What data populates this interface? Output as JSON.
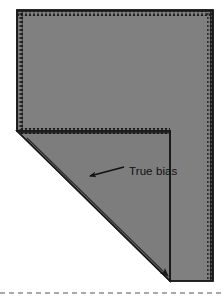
{
  "figure": {
    "annotation": {
      "label": "True bias",
      "arrow": "left-pointing-arrow"
    },
    "colors": {
      "fabric_fill": "#808080",
      "fold_flap_fill": "#7b7b7b",
      "outline": "#1a1a1a",
      "background": "#ffffff",
      "label_color": "#111111",
      "dashed_guide": "#4d4d4d"
    },
    "shape": {
      "description": "Rectangular fabric piece with bottom-left corner folded up to form a 45-degree triangular flap",
      "fabric_outline_points": "17,10 213,10 213,281 170,281 170,131 17,131",
      "fold_flap_points": "17,131 170,281 170,131",
      "fold_line_from": [
        17,
        131
      ],
      "fold_line_to": [
        170,
        281
      ],
      "fold_angle_degrees": 45
    },
    "edges": {
      "pinked_edge_style": "serrated-zigzag",
      "pinked_edges": [
        "top",
        "left",
        "right",
        "inner-horizontal"
      ]
    },
    "guide_line": {
      "style": "dashed",
      "y": 293,
      "from_x": 0,
      "to_x": 224
    },
    "arrow": {
      "tail": [
        125,
        168
      ],
      "head": [
        88,
        177
      ]
    },
    "bias_arrow": {
      "tail": [
        30,
        141
      ],
      "head": [
        166,
        274
      ]
    }
  }
}
